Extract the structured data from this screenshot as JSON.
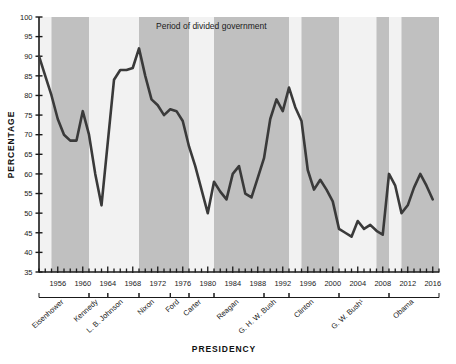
{
  "chart_data": {
    "type": "line",
    "title": "",
    "xlabel": "PRESIDENCY",
    "ylabel": "PERCENTAGE",
    "ylim": [
      35,
      100
    ],
    "xlim": [
      1953,
      2017
    ],
    "ytick_step": 5,
    "yticks": [
      35,
      40,
      45,
      50,
      55,
      60,
      65,
      70,
      75,
      80,
      85,
      90,
      95,
      100
    ],
    "xticks_labeled": [
      1956,
      1960,
      1964,
      1968,
      1972,
      1976,
      1980,
      1984,
      1988,
      1992,
      1996,
      2000,
      2004,
      2008,
      2012,
      2016
    ],
    "xtick_minor_step": 1,
    "grid": false,
    "line_color": "#3a3a3a",
    "shade_color": "#c0c0c0",
    "plot_bg": "#f2f2f2",
    "legend": {
      "position": "top-center",
      "entries": [
        {
          "label": "Period of divided government",
          "swatch": "#c0c0c0"
        }
      ]
    },
    "x": [
      1953,
      1954,
      1955,
      1956,
      1957,
      1958,
      1959,
      1960,
      1961,
      1962,
      1963,
      1964,
      1965,
      1966,
      1967,
      1968,
      1969,
      1970,
      1971,
      1972,
      1973,
      1974,
      1975,
      1976,
      1977,
      1978,
      1979,
      1980,
      1981,
      1982,
      1983,
      1984,
      1985,
      1986,
      1987,
      1988,
      1989,
      1990,
      1991,
      1992,
      1993,
      1994,
      1995,
      1996,
      1997,
      1998,
      1999,
      2000,
      2001,
      2002,
      2003,
      2004,
      2005,
      2006,
      2007,
      2008,
      2009,
      2010,
      2011,
      2012,
      2013,
      2014,
      2015,
      2016
    ],
    "values": [
      90,
      85,
      80,
      74,
      70,
      68.5,
      68.5,
      76,
      70,
      60,
      52,
      68,
      84,
      86.5,
      86.5,
      87,
      92,
      85,
      79,
      77.5,
      75,
      76.5,
      76,
      73.5,
      67,
      62,
      56,
      50,
      58,
      55.5,
      53.5,
      60,
      62,
      55,
      54,
      59,
      64,
      74,
      79,
      76,
      82,
      77,
      73.5,
      61,
      56,
      58.5,
      56,
      53,
      46,
      45,
      44,
      48,
      46,
      47,
      45.5,
      44.5,
      60,
      57,
      50,
      52,
      56.5,
      60,
      57,
      53.5
    ],
    "series_note": "Presidential success rate on congressional votes, percent",
    "shaded_periods": [
      {
        "start": 1955,
        "end": 1961
      },
      {
        "start": 1969,
        "end": 1977
      },
      {
        "start": 1981,
        "end": 1993
      },
      {
        "start": 1995,
        "end": 2001
      },
      {
        "start": 2007,
        "end": 2009
      },
      {
        "start": 2011,
        "end": 2017
      }
    ],
    "presidencies": [
      {
        "name": "Eisenhower",
        "start": 1953,
        "end": 1961
      },
      {
        "name": "Kennedy",
        "start": 1961,
        "end": 1964
      },
      {
        "name": "L. B. Johnson",
        "start": 1964,
        "end": 1969
      },
      {
        "name": "Nixon",
        "start": 1969,
        "end": 1974
      },
      {
        "name": "Ford",
        "start": 1974,
        "end": 1977
      },
      {
        "name": "Carter",
        "start": 1977,
        "end": 1981
      },
      {
        "name": "Reagan",
        "start": 1981,
        "end": 1989
      },
      {
        "name": "G. H. W. Bush",
        "start": 1989,
        "end": 1993
      },
      {
        "name": "Clinton",
        "start": 1993,
        "end": 2001
      },
      {
        "name": "G. W. Bush¹",
        "start": 2001,
        "end": 2009
      },
      {
        "name": "Obama",
        "start": 2009,
        "end": 2017
      }
    ]
  }
}
